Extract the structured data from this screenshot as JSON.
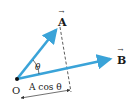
{
  "diagram": {
    "type": "vector-projection",
    "colors": {
      "vector": "#3aa3d8",
      "text": "#1a1a1a",
      "dashed": "#333333",
      "background": "#ffffff"
    },
    "labels": {
      "vector_a": "A",
      "vector_b": "B",
      "angle": "θ",
      "origin": "O",
      "projection": "A cos θ",
      "arrow_mark": "→"
    }
  }
}
